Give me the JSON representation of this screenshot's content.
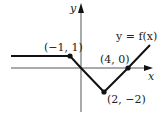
{
  "diagram": {
    "type": "function-graph",
    "function_label": "y = f(x)",
    "axes": {
      "x_label": "x",
      "y_label": "y"
    },
    "points": [
      {
        "label": "(−1, 1)",
        "x": -1,
        "y": 1
      },
      {
        "label": "(4, 0)",
        "x": 4,
        "y": 0
      },
      {
        "label": "(2, −2)",
        "x": 2,
        "y": -2
      }
    ],
    "colors": {
      "line": "#111111",
      "axis": "#555555",
      "background": "#ffffff"
    }
  }
}
